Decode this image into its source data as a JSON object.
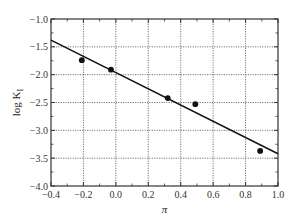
{
  "chart_data": {
    "type": "scatter",
    "title": "",
    "xlabel": "π",
    "ylabel": "log K_I",
    "ylabel_main": "log K",
    "ylabel_sub": "I",
    "xlim": [
      -0.4,
      1.0
    ],
    "ylim": [
      -4.0,
      -1.0
    ],
    "grid": true,
    "legend": null,
    "x_ticks": [
      -0.4,
      -0.2,
      0.0,
      0.2,
      0.4,
      0.6,
      0.8,
      1.0
    ],
    "x_tick_labels": [
      "−0.4",
      "−0.2",
      "0.0",
      "0.2",
      "0.4",
      "0.6",
      "0.8",
      "1.0"
    ],
    "y_ticks": [
      -1.0,
      -1.5,
      -2.0,
      -2.5,
      -3.0,
      -3.5,
      -4.0
    ],
    "y_tick_labels": [
      "−1.0",
      "−1.5",
      "−2.0",
      "−2.5",
      "−3.0",
      "−3.5",
      "−4.0"
    ],
    "series": [
      {
        "name": "data",
        "kind": "points",
        "x": [
          -0.21,
          -0.03,
          0.32,
          0.49,
          0.89
        ],
        "y": [
          -1.74,
          -1.91,
          -2.42,
          -2.53,
          -3.37
        ]
      },
      {
        "name": "linear fit",
        "kind": "line",
        "x": [
          -0.4,
          1.0
        ],
        "y": [
          -1.38,
          -3.42
        ]
      }
    ],
    "colors": {
      "points": "#111111",
      "line": "#111111",
      "grid": "#555555",
      "frame": "#333333"
    }
  }
}
